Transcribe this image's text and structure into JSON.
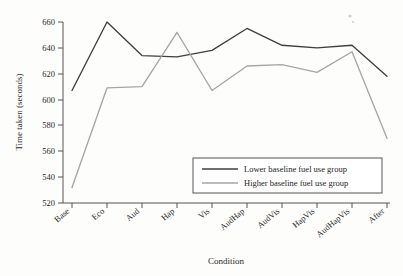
{
  "chart_data": {
    "type": "line",
    "title": "",
    "xlabel": "Condition",
    "ylabel": "Time taken (seconds)",
    "categories": [
      "Base",
      "Eco",
      "Aud",
      "Hap",
      "Vis",
      "AudHap",
      "AudVis",
      "HapVis",
      "AudHapVis",
      "After"
    ],
    "ylim": [
      520,
      660
    ],
    "yticks": [
      520,
      540,
      560,
      580,
      600,
      620,
      640,
      660
    ],
    "ytick_labels": [
      "520",
      "540",
      "560",
      "580",
      "600",
      "620",
      "640",
      "660"
    ],
    "grid": false,
    "legend_position": "lower-right-inside",
    "series": [
      {
        "name": "Lower baseline fuel use group",
        "color": "#3f3f3f",
        "values": [
          607,
          660,
          634,
          633,
          638,
          655,
          642,
          640,
          642,
          618
        ]
      },
      {
        "name": "Higher baseline fuel use group",
        "color": "#a6a6a6",
        "values": [
          532,
          609,
          610,
          652,
          607,
          626,
          627,
          621,
          637,
          570
        ]
      }
    ]
  },
  "axes": {
    "y_axis_title": "Time taken (seconds)",
    "x_axis_title": "Condition"
  },
  "legend": {
    "entries": [
      {
        "label": "Lower baseline fuel use group",
        "color": "#3f3f3f"
      },
      {
        "label": "Higher baseline fuel use group",
        "color": "#a6a6a6"
      }
    ]
  }
}
